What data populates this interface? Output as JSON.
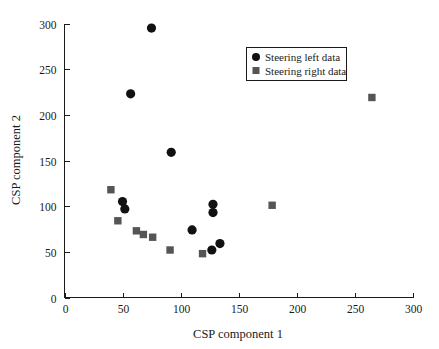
{
  "chart_data": {
    "type": "scatter",
    "title": "",
    "xlabel": "CSP component 1",
    "ylabel": "CSP component 2",
    "xlim": [
      0,
      300
    ],
    "ylim": [
      0,
      300
    ],
    "xticks": [
      "0",
      "50",
      "100",
      "150",
      "200",
      "250",
      "300"
    ],
    "yticks": [
      "0",
      "50",
      "100",
      "150",
      "200",
      "250",
      "300"
    ],
    "grid": false,
    "legend_position": "upper-right",
    "series": [
      {
        "name": "Steering left data",
        "marker": "circle",
        "color": "#111111",
        "points": [
          [
            75,
            295
          ],
          [
            57,
            223
          ],
          [
            92,
            159
          ],
          [
            50,
            105
          ],
          [
            52,
            97
          ],
          [
            110,
            74
          ],
          [
            128,
            102
          ],
          [
            128,
            93
          ],
          [
            134,
            59
          ],
          [
            127,
            52
          ]
        ]
      },
      {
        "name": "Steering right data",
        "marker": "square",
        "color": "#555555",
        "points": [
          [
            40,
            118
          ],
          [
            46,
            84
          ],
          [
            62,
            73
          ],
          [
            68,
            69
          ],
          [
            76,
            66
          ],
          [
            91,
            52
          ],
          [
            119,
            48
          ],
          [
            179,
            101
          ],
          [
            265,
            219
          ]
        ]
      }
    ]
  },
  "legend": {
    "entries": [
      {
        "label": "Steering left data",
        "marker": "circle-marker",
        "color": "#111111"
      },
      {
        "label": "Steering right data",
        "marker": "square-marker",
        "color": "#555555"
      }
    ]
  },
  "axes": {
    "x_title": "CSP component 1",
    "y_title": "CSP component 2",
    "x_tick_labels": [
      "0",
      "50",
      "100",
      "150",
      "200",
      "250",
      "300"
    ],
    "y_tick_labels": [
      "0",
      "50",
      "100",
      "150",
      "200",
      "250",
      "300"
    ]
  }
}
